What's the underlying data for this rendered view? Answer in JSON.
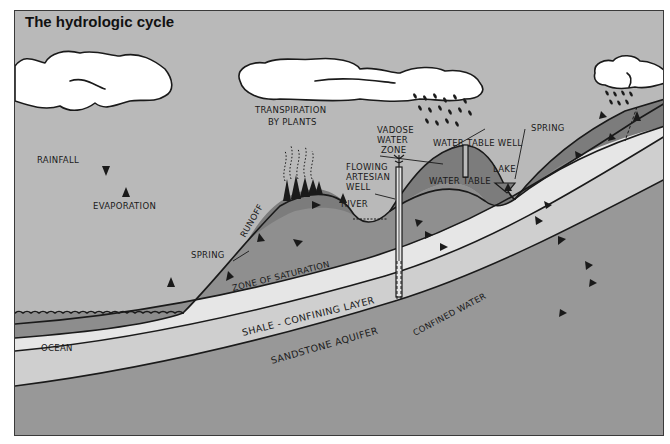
{
  "title": "The hydrologic cycle",
  "colors": {
    "sky": "#b9b9b9",
    "cloud": "#ffffff",
    "ocean": "#8d8d8d",
    "zone_of_saturation": "#8f8f8f",
    "vadose_zone": "#7c7c7c",
    "shale_layer": "#e6e6e6",
    "sandstone_aquifer": "#cfcfcf",
    "bedrock": "#989898",
    "ink": "#1a1a1a"
  },
  "labels": {
    "rainfall": "RAINFALL",
    "evaporation": "EVAPORATION",
    "transpiration_line1": "TRANSPIRATION",
    "transpiration_line2": "BY PLANTS",
    "runoff": "RUNOFF",
    "spring_left": "SPRING",
    "river": "RIVER",
    "flowing_line1": "FLOWING",
    "flowing_line2": "ARTESIAN",
    "flowing_line3": "WELL",
    "vadose_line1": "VADOSE",
    "vadose_line2": "WATER",
    "vadose_line3": "ZONE",
    "water_table_well": "WATER TABLE WELL",
    "water_table": "WATER TABLE",
    "spring_right": "SPRING",
    "lake": "LAKE",
    "zone_of_saturation": "ZONE OF SATURATION",
    "shale": "SHALE - CONFINING LAYER",
    "sandstone": "SANDSTONE AQUIFER",
    "confined_water": "CONFINED WATER",
    "ocean": "OCEAN"
  },
  "icons": {
    "flow_arrow": "triangle-arrow",
    "rain": "raindrop-dashes",
    "trees": "conifer-trees"
  }
}
